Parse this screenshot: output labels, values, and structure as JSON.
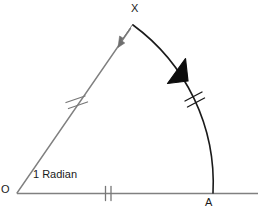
{
  "figure": {
    "type": "geometry-diagram",
    "background_color": "#ffffff",
    "width": 272,
    "height": 219
  },
  "caption": {
    "angle_text": "1 Radian"
  },
  "points": {
    "origin": {
      "label": "O",
      "x": 17,
      "y": 193
    },
    "arc_end": {
      "label": "A",
      "x": 213,
      "y": 193
    },
    "arc_start": {
      "label": "X",
      "x": 133,
      "y": 25
    }
  },
  "colors": {
    "radius_line": "#808080",
    "baseline": "#808080",
    "arc": "#1a1a1a",
    "label": "#1a1a1a",
    "arrow_radius": "#6e6e6e",
    "arrow_arc": "#0d0d0d"
  },
  "segments": [
    {
      "name": "radius-OX",
      "from": "O",
      "to": "X",
      "tick_marks": 2,
      "tick_position": {
        "x": 76,
        "y": 102
      },
      "arrowhead": "at-X",
      "color": "#808080"
    },
    {
      "name": "baseline-OA",
      "from": "O",
      "to": "A",
      "tick_marks": 2,
      "tick_position": {
        "x": 108,
        "y": 193
      },
      "arrowhead": "none",
      "color": "#808080",
      "extends_to_x": 258
    },
    {
      "name": "arc-AX",
      "from": "A",
      "to": "X",
      "tick_marks": 2,
      "tick_position": {
        "x": 193,
        "y": 100
      },
      "arrowhead": "mid-toward-X",
      "color": "#1a1a1a",
      "radius": 196
    }
  ],
  "annotations": {
    "equal_length_note": "radius OX, radius OA and arc AX carry matching double tick marks"
  }
}
